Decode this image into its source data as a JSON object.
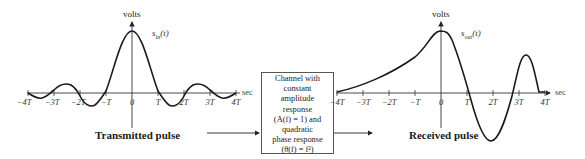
{
  "left_plot": {
    "y_label": "volts",
    "x_unit": "sec",
    "signal_label": "s",
    "signal_sub": "in",
    "signal_arg": "(t)",
    "ticks": [
      "−4T",
      "−3T",
      "−2T",
      "−T",
      "0",
      "T",
      "2T",
      "3T",
      "4T"
    ],
    "title": "Transmitted pulse"
  },
  "channel_box": {
    "lines": [
      "Channel with",
      "constant",
      "amplitude",
      "response",
      "(A(f) = 1) and",
      "quadratic",
      "phase response",
      "(θ(f) = f²)"
    ]
  },
  "right_plot": {
    "y_label": "volts",
    "x_unit": "sec",
    "signal_label": "s",
    "signal_sub": "out",
    "signal_arg": "(t)",
    "ticks": [
      "−4T",
      "−3T",
      "−2T",
      "−T",
      "0",
      "T",
      "2T",
      "3T",
      "4T"
    ],
    "title": "Received pulse"
  },
  "colors": {
    "line": "#1a1a1a",
    "axis": "#333333",
    "box_border": "#555555"
  }
}
